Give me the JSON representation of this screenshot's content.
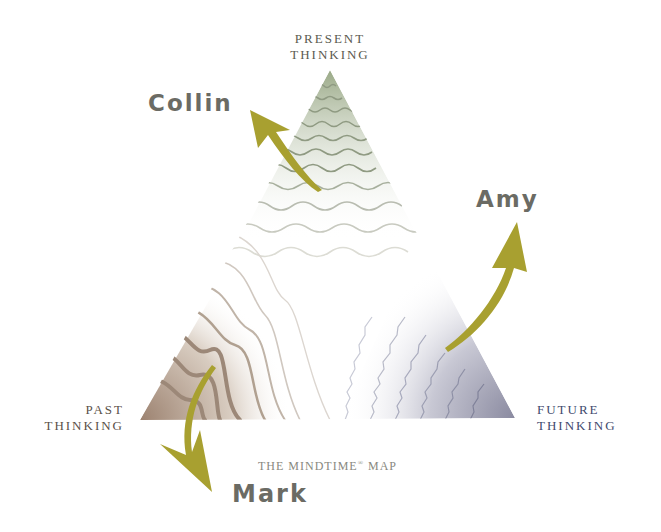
{
  "title": "THE MINDTIME® MAP",
  "title_parts": {
    "the": "THE ",
    "mindtime": "MINDTIME",
    "reg": "®",
    "map": " MAP"
  },
  "vertices": {
    "present": {
      "line1": "PRESENT",
      "line2": "THINKING",
      "color": "#5a5a50"
    },
    "past": {
      "line1": "PAST",
      "line2": "THINKING",
      "color": "#5a5048"
    },
    "future": {
      "line1": "FUTURE",
      "line2": "THINKING",
      "color": "#3f4a6e"
    }
  },
  "people": {
    "collin": "Collin",
    "amy": "Amy",
    "mark": "Mark"
  },
  "colors": {
    "arrow": "#a8a030",
    "present_zone": "#8fa07a",
    "past_zone": "#9c8270",
    "future_zone": "#8a8aa0",
    "name_text": "#6b6b64"
  }
}
